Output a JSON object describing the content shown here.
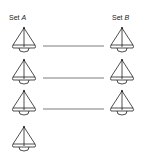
{
  "labels": {
    "set_a_prefix": "Set",
    "set_a_letter": "A",
    "set_b_prefix": "Set",
    "set_b_letter": "B"
  },
  "diagram": {
    "set_a_count": 4,
    "set_b_count": 3,
    "icon": "sailboat-icon",
    "connections": [
      [
        1,
        1
      ],
      [
        2,
        2
      ],
      [
        3,
        3
      ]
    ]
  },
  "colors": {
    "stroke": "#222222",
    "background": "#ffffff"
  }
}
